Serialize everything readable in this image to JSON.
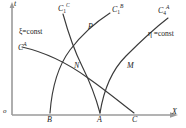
{
  "figure": {
    "axes": {
      "y_label": "t",
      "x_label": "X",
      "origin_label": "o",
      "axis_color": "#8a8a8a"
    },
    "curve_color": "#3a3a3a",
    "families": [
      {
        "id": "xi",
        "label": "ξ=const"
      },
      {
        "id": "eta",
        "label": "η =const"
      }
    ],
    "curve_labels": [
      {
        "id": "c-a",
        "base": "C",
        "sub": "",
        "sup": "A"
      },
      {
        "id": "c-c",
        "base": "C",
        "sub": "1",
        "sup": "C"
      },
      {
        "id": "c-b",
        "base": "C",
        "sub": "1",
        "sup": "B"
      },
      {
        "id": "c-a4",
        "base": "C",
        "sub": "4",
        "sup": "A"
      }
    ],
    "base_points": [
      {
        "id": "B",
        "label": "B"
      },
      {
        "id": "A",
        "label": "A"
      },
      {
        "id": "C",
        "label": "C"
      }
    ],
    "intersections": [
      {
        "id": "N",
        "label": "N"
      },
      {
        "id": "P",
        "label": "P"
      },
      {
        "id": "M",
        "label": "M"
      }
    ]
  }
}
